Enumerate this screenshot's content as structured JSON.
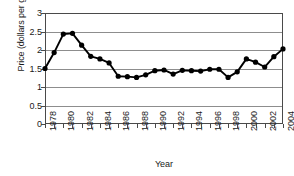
{
  "chart_data": {
    "type": "line",
    "title": "",
    "xlabel": "Year",
    "ylabel": "Price (dollars per gallon)",
    "xlim": [
      1978,
      2004
    ],
    "ylim": [
      0,
      3
    ],
    "yticks": [
      0,
      0.5,
      1,
      1.5,
      2,
      2.5,
      3
    ],
    "ytick_labels": [
      "0",
      "0.5",
      "1",
      "1.5",
      "2",
      "2.5",
      "3"
    ],
    "xticks": [
      1978,
      1979,
      1980,
      1981,
      1982,
      1983,
      1984,
      1985,
      1986,
      1987,
      1988,
      1989,
      1990,
      1991,
      1992,
      1993,
      1994,
      1995,
      1996,
      1997,
      1998,
      1999,
      2000,
      2001,
      2002,
      2003,
      2004
    ],
    "xtick_labels": [
      "1978",
      "",
      "1980",
      "",
      "1982",
      "",
      "1984",
      "",
      "1986",
      "",
      "1988",
      "",
      "1990",
      "",
      "1992",
      "",
      "1994",
      "",
      "1996",
      "",
      "1998",
      "",
      "2000",
      "",
      "2002",
      "",
      "2004"
    ],
    "grid": true,
    "legend": false,
    "marker": "filled-circle",
    "line_color": "#000000",
    "marker_color": "#000000",
    "grid_color": "#8d8d8d",
    "x": [
      1978,
      1979,
      1980,
      1981,
      1982,
      1983,
      1984,
      1985,
      1986,
      1987,
      1988,
      1989,
      1990,
      1991,
      1992,
      1993,
      1994,
      1995,
      1996,
      1997,
      1998,
      1999,
      2000,
      2001,
      2002,
      2003,
      2004
    ],
    "values": [
      1.5,
      1.93,
      2.43,
      2.45,
      2.13,
      1.83,
      1.76,
      1.65,
      1.29,
      1.28,
      1.26,
      1.33,
      1.44,
      1.46,
      1.35,
      1.45,
      1.44,
      1.43,
      1.48,
      1.48,
      1.26,
      1.41,
      1.76,
      1.67,
      1.54,
      1.82,
      2.03
    ],
    "series_name": "Price (dollars per gallon)"
  },
  "axis": {
    "y_title": "Price (dollars per gallon)",
    "x_title": "Year"
  }
}
